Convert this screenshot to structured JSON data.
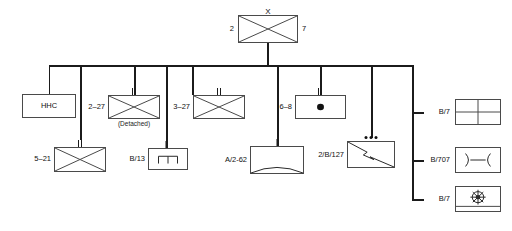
{
  "diagram": {
    "type": "military-unit-organization-chart",
    "line_color": "#1b1b1b",
    "box_border_color": "#4a4a4a",
    "background": "#ffffff"
  },
  "root": {
    "label_left": "2",
    "label_right": "7",
    "echelon": "X",
    "echelon_meaning": "brigade",
    "symbol": "infantry-cross"
  },
  "row1": [
    {
      "name": "hhc",
      "label": "HHC",
      "label_position": "inside",
      "echelon": "",
      "symbol": "plain-box",
      "note": ""
    },
    {
      "name": "2-27",
      "label": "2–27",
      "label_position": "left",
      "echelon": "II",
      "echelon_meaning": "battalion",
      "symbol": "infantry-cross",
      "note": "(Detached)"
    },
    {
      "name": "3-27",
      "label": "3–27",
      "label_position": "left",
      "echelon": "II",
      "echelon_meaning": "battalion",
      "symbol": "infantry-cross",
      "note": ""
    },
    {
      "name": "6-8",
      "label": "6–8",
      "label_position": "left",
      "echelon": "II",
      "echelon_meaning": "battalion",
      "symbol": "reconnaissance-dot",
      "note": ""
    }
  ],
  "row2": [
    {
      "name": "5-21",
      "label": "5–21",
      "label_position": "left",
      "echelon": "II",
      "echelon_meaning": "battalion",
      "symbol": "infantry-cross",
      "note": ""
    },
    {
      "name": "b-13",
      "label": "B/13",
      "label_position": "left",
      "echelon": "I",
      "echelon_meaning": "company",
      "symbol": "engineer-bracket",
      "note": ""
    },
    {
      "name": "a-2-62",
      "label": "A/2-62",
      "label_position": "left",
      "echelon": "I",
      "echelon_meaning": "company",
      "symbol": "air-defense-arc",
      "note": ""
    },
    {
      "name": "2-b-127",
      "label": "2/B/127",
      "label_position": "left",
      "echelon": "•••",
      "echelon_meaning": "platoon",
      "symbol": "signal-lightning",
      "note": ""
    }
  ],
  "support_column": [
    {
      "name": "b-7-medical",
      "label": "B/7",
      "label_position": "left",
      "echelon": "",
      "symbol": "medical-quadrants",
      "note": ""
    },
    {
      "name": "b-707-maintenance",
      "label": "B/707",
      "label_position": "left",
      "echelon": "",
      "symbol": "maintenance-arcs",
      "note": ""
    },
    {
      "name": "b-7-supply",
      "label": "B/7",
      "label_position": "left",
      "echelon": "",
      "symbol": "supply-wheel",
      "note": ""
    }
  ]
}
